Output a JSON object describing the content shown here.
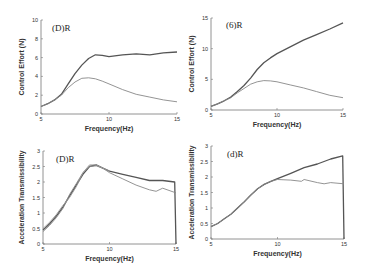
{
  "chart_data": [
    {
      "id": "a",
      "type": "line",
      "panel_label": "(D)R",
      "xlabel": "Frequency(Hz)",
      "ylabel": "Control Effort (N)",
      "xlim": [
        5,
        15
      ],
      "ylim": [
        0,
        10
      ],
      "xticks": [
        5,
        10,
        15
      ],
      "yticks": [
        0,
        2,
        4,
        6,
        8,
        10
      ],
      "grid": false,
      "legend": null,
      "series": [
        {
          "name": "upper",
          "x": [
            5,
            5.5,
            6,
            6.5,
            7,
            7.5,
            8,
            8.5,
            9,
            9.5,
            10,
            11,
            12,
            13,
            14,
            15
          ],
          "y": [
            0.8,
            1.1,
            1.5,
            2.1,
            3.2,
            4.3,
            5.2,
            5.9,
            6.3,
            6.25,
            6.1,
            6.3,
            6.4,
            6.3,
            6.5,
            6.6
          ]
        },
        {
          "name": "lower",
          "x": [
            5,
            5.5,
            6,
            6.5,
            7,
            7.5,
            8,
            8.5,
            9,
            9.5,
            10,
            11,
            12,
            13,
            14,
            15
          ],
          "y": [
            0.8,
            1.1,
            1.5,
            2.0,
            2.8,
            3.4,
            3.8,
            3.85,
            3.75,
            3.5,
            3.2,
            2.6,
            2.1,
            1.8,
            1.5,
            1.3
          ]
        }
      ]
    },
    {
      "id": "b",
      "type": "line",
      "panel_label": "(6)R",
      "xlabel": "Frequency(Hz)",
      "ylabel": "Control Effort (N)",
      "xlim": [
        5,
        15
      ],
      "ylim": [
        0,
        15
      ],
      "xticks": [
        5,
        10,
        15
      ],
      "yticks": [
        0,
        5,
        10,
        15
      ],
      "grid": false,
      "legend": null,
      "series": [
        {
          "name": "upper",
          "x": [
            5,
            5.5,
            6,
            6.5,
            7,
            7.5,
            8,
            8.5,
            9,
            9.5,
            10,
            11,
            12,
            13,
            14,
            15
          ],
          "y": [
            0.6,
            1.0,
            1.5,
            2.1,
            3.0,
            4.0,
            5.2,
            6.6,
            7.7,
            8.5,
            9.2,
            10.3,
            11.4,
            12.3,
            13.2,
            14.2
          ]
        },
        {
          "name": "lower",
          "x": [
            5,
            5.5,
            6,
            6.5,
            7,
            7.5,
            8,
            8.5,
            9,
            9.5,
            10,
            11,
            12,
            13,
            14,
            15
          ],
          "y": [
            0.6,
            1.0,
            1.5,
            2.0,
            2.8,
            3.5,
            4.2,
            4.6,
            4.8,
            4.75,
            4.6,
            4.1,
            3.6,
            3.0,
            2.4,
            2.0
          ]
        }
      ]
    },
    {
      "id": "c",
      "type": "line",
      "panel_label": "(D)R",
      "xlabel": "Frequency(Hz)",
      "ylabel": "Acceleration Transmissibility",
      "xlim": [
        5,
        15
      ],
      "ylim": [
        0,
        3
      ],
      "xticks": [
        5,
        10,
        15
      ],
      "yticks": [
        0,
        0.5,
        1,
        1.5,
        2,
        2.5,
        3
      ],
      "grid": false,
      "legend": null,
      "series": [
        {
          "name": "upper",
          "x": [
            5,
            5.5,
            6,
            6.5,
            7,
            7.5,
            8,
            8.5,
            9,
            9.5,
            10,
            11,
            12,
            13,
            14,
            14.9,
            15
          ],
          "y": [
            0.45,
            0.65,
            0.9,
            1.2,
            1.55,
            1.9,
            2.25,
            2.5,
            2.55,
            2.45,
            2.35,
            2.25,
            2.15,
            2.05,
            2.05,
            2.0,
            0
          ]
        },
        {
          "name": "lower",
          "x": [
            5,
            5.5,
            6,
            6.5,
            7,
            7.5,
            8,
            8.5,
            9,
            9.5,
            10,
            11,
            12,
            13,
            13.5,
            14,
            15
          ],
          "y": [
            0.4,
            0.6,
            0.85,
            1.15,
            1.6,
            1.95,
            2.3,
            2.5,
            2.52,
            2.45,
            2.3,
            2.1,
            1.9,
            1.75,
            1.7,
            1.8,
            1.65
          ]
        },
        {
          "name": "third",
          "x": [
            5,
            5.5,
            6,
            6.5,
            7,
            7.5,
            8,
            8.5,
            9,
            9.5,
            10
          ],
          "y": [
            0.5,
            0.7,
            0.95,
            1.25,
            1.5,
            1.85,
            2.3,
            2.55,
            2.55,
            2.45,
            2.35
          ]
        }
      ]
    },
    {
      "id": "d",
      "type": "line",
      "panel_label": "(d)R",
      "xlabel": "Frequency(Hz)",
      "ylabel": "Acceleration Transmissibility",
      "xlim": [
        5,
        15
      ],
      "ylim": [
        0,
        3
      ],
      "xticks": [
        5,
        10,
        15
      ],
      "yticks": [
        0,
        0.5,
        1,
        1.5,
        2,
        2.5,
        3
      ],
      "grid": false,
      "legend": null,
      "series": [
        {
          "name": "upper",
          "x": [
            5,
            5.5,
            6,
            6.5,
            7,
            7.5,
            8,
            8.5,
            9,
            9.5,
            10,
            11,
            12,
            13,
            14,
            14.9,
            15
          ],
          "y": [
            0.4,
            0.5,
            0.65,
            0.8,
            1.0,
            1.2,
            1.42,
            1.62,
            1.76,
            1.86,
            1.95,
            2.12,
            2.3,
            2.42,
            2.58,
            2.68,
            0
          ]
        },
        {
          "name": "lower",
          "x": [
            5,
            5.5,
            6,
            6.5,
            7,
            7.5,
            8,
            8.5,
            9,
            9.5,
            10,
            11,
            11.8,
            12,
            13,
            13.5,
            14,
            15
          ],
          "y": [
            0.4,
            0.5,
            0.65,
            0.8,
            1.0,
            1.2,
            1.42,
            1.62,
            1.76,
            1.86,
            1.92,
            1.9,
            1.86,
            1.92,
            1.82,
            1.78,
            1.82,
            1.78
          ]
        }
      ]
    }
  ],
  "layout": {
    "panels": [
      {
        "left": 41,
        "right": 177,
        "top": 20,
        "bottom": 114,
        "label_x": 52,
        "label_y": 31,
        "title_y": 131,
        "ylabel_x": 24
      },
      {
        "left": 211,
        "right": 343,
        "top": 18,
        "bottom": 110,
        "label_x": 226,
        "label_y": 28,
        "title_y": 127,
        "ylabel_x": 194
      },
      {
        "left": 43,
        "right": 176,
        "top": 151,
        "bottom": 244,
        "label_x": 56,
        "label_y": 162,
        "title_y": 261,
        "ylabel_x": 24
      },
      {
        "left": 211,
        "right": 344,
        "top": 146,
        "bottom": 239,
        "label_x": 227,
        "label_y": 157,
        "title_y": 256,
        "ylabel_x": 194
      }
    ],
    "colors": {
      "upper": "#555555",
      "lower": "#888888",
      "third": "#999999",
      "axis": "#777777",
      "text": "#333333"
    }
  }
}
